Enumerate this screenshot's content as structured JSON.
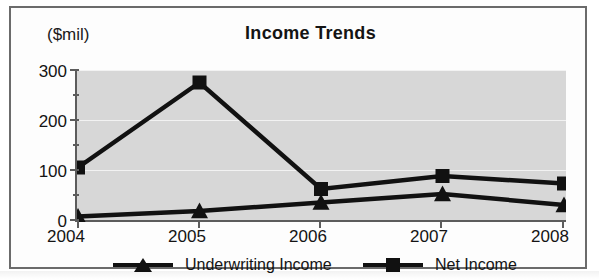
{
  "chart_data": {
    "type": "line",
    "title": "Income Trends",
    "xlabel": "",
    "ylabel": "($mil)",
    "categories": [
      "2004",
      "2005",
      "2006",
      "2007",
      "2008"
    ],
    "series": [
      {
        "name": "Underwriting Income",
        "marker": "triangle",
        "color": "#111111",
        "values": [
          7,
          18,
          35,
          52,
          30
        ]
      },
      {
        "name": "Net Income",
        "marker": "square",
        "color": "#111111",
        "values": [
          105,
          275,
          62,
          88,
          73
        ]
      }
    ],
    "ylim": [
      0,
      300
    ],
    "yticks": [
      0,
      100,
      200,
      300
    ],
    "yticks_minor": [
      50,
      150,
      250
    ],
    "grid": true,
    "legend_position": "bottom",
    "plot_background": "#d7d7d7"
  },
  "axis": {
    "unit_caption": "($mil)",
    "y_labels": [
      "300",
      "200",
      "100",
      "0"
    ],
    "x_labels": [
      "2004",
      "2005",
      "2006",
      "2007",
      "2008"
    ]
  },
  "legend": {
    "entries": [
      {
        "label": "Underwriting Income",
        "marker": "triangle-marker"
      },
      {
        "label": "Net Income",
        "marker": "square-marker"
      }
    ]
  }
}
